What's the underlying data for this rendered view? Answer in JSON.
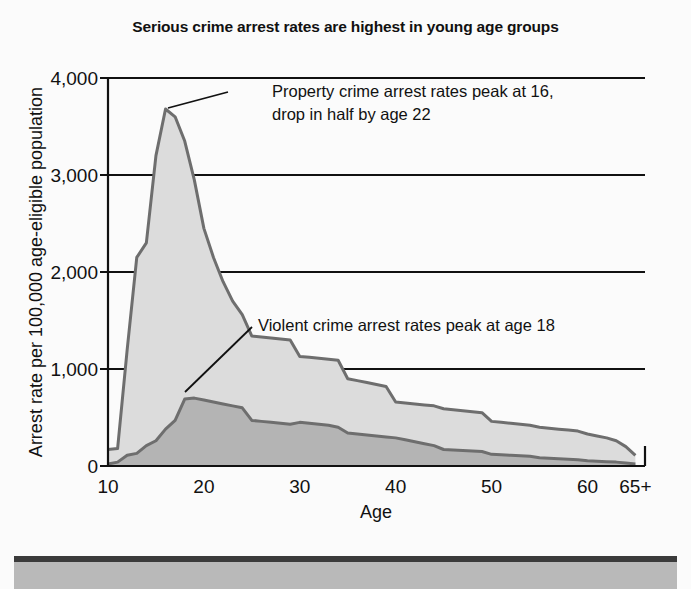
{
  "chart_data": {
    "type": "area",
    "stacked": true,
    "title": "Serious crime arrest rates are highest in young age groups",
    "xlabel": "Age",
    "ylabel": "Arrest rate per 100,000 age-eligible population",
    "xlim": [
      10,
      66
    ],
    "ylim": [
      0,
      4000
    ],
    "ytick_values": [
      0,
      1000,
      2000,
      3000,
      4000
    ],
    "ytick_labels": [
      "0",
      "1,000",
      "2,000",
      "3,000",
      "4,000"
    ],
    "xtick_values": [
      10,
      20,
      30,
      40,
      50,
      60,
      65
    ],
    "xtick_labels": [
      "10",
      "20",
      "30",
      "40",
      "50",
      "60",
      "65+"
    ],
    "grid": "horizontal",
    "legend": "none",
    "x": [
      10,
      11,
      12,
      13,
      14,
      15,
      16,
      17,
      18,
      19,
      20,
      21,
      22,
      23,
      24,
      25,
      26,
      27,
      28,
      29,
      30,
      31,
      32,
      33,
      34,
      35,
      36,
      37,
      38,
      39,
      40,
      41,
      42,
      43,
      44,
      45,
      46,
      47,
      48,
      49,
      50,
      51,
      52,
      53,
      54,
      55,
      56,
      57,
      58,
      59,
      60,
      61,
      62,
      63,
      64,
      65
    ],
    "series": [
      {
        "name": "Violent crime arrest rate",
        "color": "#b4b4b4",
        "values": [
          20,
          40,
          110,
          130,
          210,
          260,
          380,
          470,
          690,
          700,
          680,
          660,
          640,
          620,
          600,
          470,
          460,
          450,
          440,
          430,
          450,
          440,
          430,
          420,
          400,
          340,
          330,
          320,
          310,
          300,
          290,
          270,
          250,
          230,
          210,
          170,
          165,
          160,
          155,
          150,
          120,
          115,
          110,
          105,
          100,
          85,
          80,
          75,
          70,
          65,
          55,
          50,
          45,
          40,
          30,
          20
        ]
      },
      {
        "name": "Property crime arrest rate (total, stacked)",
        "color": "#dcdcdc",
        "values": [
          170,
          180,
          1200,
          2150,
          2300,
          3200,
          3680,
          3600,
          3350,
          2950,
          2450,
          2150,
          1900,
          1700,
          1560,
          1340,
          1330,
          1320,
          1310,
          1300,
          1130,
          1120,
          1110,
          1100,
          1090,
          900,
          880,
          860,
          840,
          820,
          660,
          650,
          640,
          630,
          620,
          590,
          580,
          570,
          560,
          550,
          460,
          450,
          440,
          430,
          420,
          400,
          390,
          380,
          370,
          360,
          330,
          310,
          290,
          260,
          200,
          110
        ]
      }
    ],
    "annotations": [
      {
        "id": "property-annotation",
        "lines": [
          "Property crime arrest rates peak at 16,",
          "drop in half by age 22"
        ],
        "text_x": 272,
        "text_y": 97,
        "leader": {
          "x1": 228,
          "y1": 92,
          "x2": 168,
          "y2": 108
        }
      },
      {
        "id": "violent-annotation",
        "lines": [
          "Violent crime arrest rates peak at age 18"
        ],
        "text_x": 258,
        "text_y": 331,
        "leader": {
          "x1": 252,
          "y1": 327,
          "x2": 185,
          "y2": 392
        }
      }
    ]
  },
  "footer": {
    "bar_color": "#b9b9b9",
    "border_color": "#3b3b3b"
  }
}
